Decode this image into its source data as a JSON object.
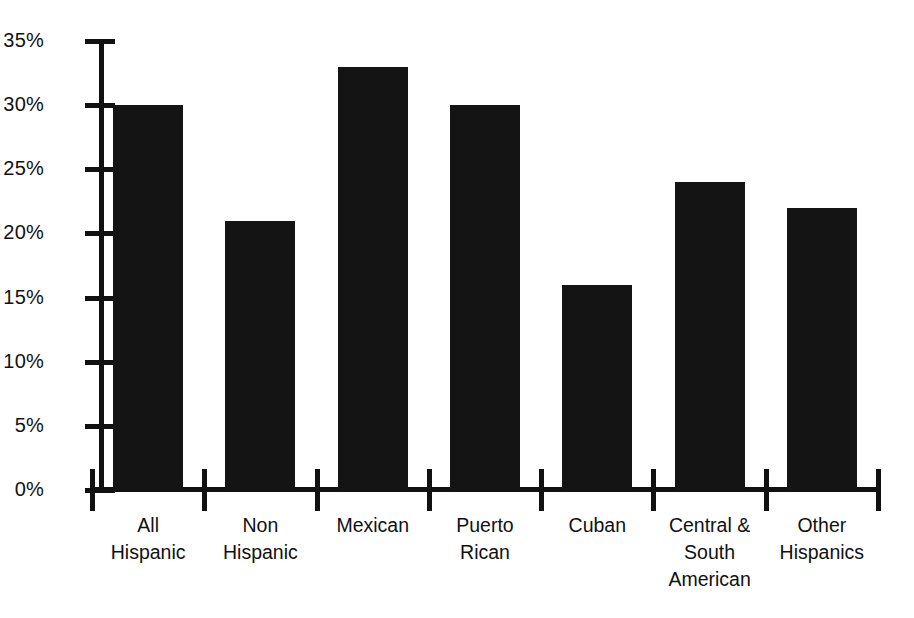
{
  "chart_data": {
    "type": "bar",
    "title": "",
    "subtitle": "",
    "xlabel": "",
    "ylabel": "",
    "categories": [
      "All\nHispanic",
      "Non\nHispanic",
      "Mexican",
      "Puerto\nRican",
      "Cuban",
      "Central &\nSouth\nAmerican",
      "Other\nHispanics"
    ],
    "values": [
      30,
      21,
      33,
      30,
      16,
      24,
      22
    ],
    "value_suffix": "%",
    "ylim": [
      0,
      35
    ],
    "ytick_values": [
      35,
      30,
      25,
      20,
      15,
      10,
      5,
      0
    ],
    "ytick_labels": [
      "35%",
      "30%",
      "25%",
      "20%",
      "15%",
      "10%",
      "5%",
      "0%"
    ],
    "grid": false,
    "legend": false,
    "legend_position": "none",
    "bar_color": "#141414",
    "axis_color": "#111111",
    "background_color": "#ffffff"
  },
  "axis": {
    "y": {
      "ticks": [
        {
          "label": "35%",
          "value": 35
        },
        {
          "label": "30%",
          "value": 30
        },
        {
          "label": "25%",
          "value": 25
        },
        {
          "label": "20%",
          "value": 20
        },
        {
          "label": "15%",
          "value": 15
        },
        {
          "label": "10%",
          "value": 10
        },
        {
          "label": "5%",
          "value": 5
        },
        {
          "label": "0%",
          "value": 0
        }
      ]
    },
    "x": {
      "labels": [
        "All\nHispanic",
        "Non\nHispanic",
        "Mexican",
        "Puerto\nRican",
        "Cuban",
        "Central &\nSouth\nAmerican",
        "Other\nHispanics"
      ]
    }
  }
}
